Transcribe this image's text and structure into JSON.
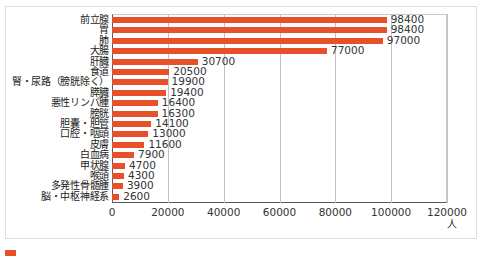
{
  "chart_data": {
    "type": "bar",
    "orientation": "horizontal",
    "title": "",
    "xlabel": "人",
    "ylabel": "",
    "xlim": [
      0,
      120000
    ],
    "xticks": [
      0,
      20000,
      40000,
      60000,
      80000,
      100000,
      120000
    ],
    "xtick_labels": [
      "0",
      "20000",
      "40000",
      "60000",
      "80000",
      "100000",
      "120000"
    ],
    "grid": true,
    "legend": false,
    "bar_color": "#e8502a",
    "categories": [
      "前立腺",
      "胃",
      "肺",
      "大腸",
      "肝臓",
      "食道",
      "腎・尿路（膀胱除く）",
      "膵臓",
      "悪性リンパ腫",
      "膀胱",
      "胆囊・胆管",
      "口腔・咽頭",
      "皮膚",
      "白血病",
      "甲状腺",
      "喉頭",
      "多発性骨髄腫",
      "脳・中枢神経系"
    ],
    "values": [
      98400,
      98400,
      97000,
      77000,
      30700,
      20500,
      19900,
      19400,
      16400,
      16300,
      14100,
      13000,
      11600,
      7900,
      4700,
      4300,
      3900,
      2600
    ],
    "value_labels": [
      "98400",
      "98400",
      "97000",
      "77000",
      "30700",
      "20500",
      "19900",
      "19400",
      "16400",
      "16300",
      "14100",
      "13000",
      "11600",
      "7900",
      "4700",
      "4300",
      "3900",
      "2600"
    ]
  },
  "axis": {
    "unit_label": "人"
  }
}
